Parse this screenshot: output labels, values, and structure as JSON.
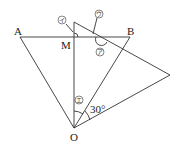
{
  "diagram": {
    "points": {
      "A": {
        "label": "A",
        "x": 20,
        "y": 37
      },
      "B": {
        "label": "B",
        "x": 130,
        "y": 37
      },
      "M": {
        "label": "M",
        "x": 74,
        "y": 37
      },
      "O": {
        "label": "O",
        "x": 74,
        "y": 128
      },
      "P": {
        "label": "",
        "x": 74,
        "y": 22
      },
      "Q": {
        "label": "",
        "x": 170,
        "y": 75
      }
    },
    "angle_labels": {
      "a": "ア",
      "i": "イ",
      "u": "ウ",
      "e": "エ",
      "given": "30°"
    }
  }
}
